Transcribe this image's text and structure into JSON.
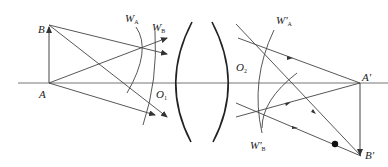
{
  "diagram": {
    "type": "optical-ray-diagram",
    "labels": {
      "A": "A",
      "B": "B",
      "WA": "W",
      "WA_sub": "A",
      "WB": "W",
      "WB_sub": "B",
      "O1": "O",
      "O1_sub": "1",
      "O2": "O",
      "O2_sub": "2",
      "WpA": "W'",
      "WpA_sub": "A",
      "WpB": "W'",
      "WpB_sub": "B",
      "Ap": "A'",
      "Bp": "B'"
    },
    "colors": {
      "line": "#444444",
      "lens": "#222222",
      "text": "#222222"
    }
  }
}
